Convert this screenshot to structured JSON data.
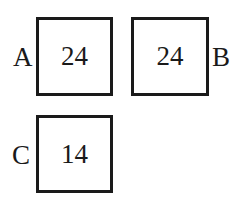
{
  "boxes": [
    {
      "label": "A",
      "value": "24",
      "label_side": "left"
    },
    {
      "label": "B",
      "value": "24",
      "label_side": "right"
    },
    {
      "label": "C",
      "value": "14",
      "label_side": "left"
    }
  ]
}
